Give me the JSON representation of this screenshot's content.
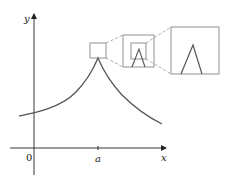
{
  "figure": {
    "axes": {
      "x_label": "x",
      "y_label": "y",
      "origin_label": "0",
      "tick_label": "a"
    },
    "zoom_boxes": [
      {
        "level": 1,
        "content": "cusp peak region"
      },
      {
        "level": 2,
        "content": "magnified cusp with nested box"
      },
      {
        "level": 3,
        "content": "further magnified cusp (still a sharp corner)"
      }
    ],
    "colors": {
      "curve": "#555555",
      "axes": "#222222",
      "boxes": "#777777",
      "dashed_connectors": "#888888"
    }
  }
}
